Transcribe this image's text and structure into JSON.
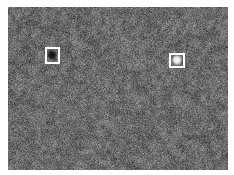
{
  "figure": {
    "type": "annotated-grayscale-micrograph",
    "canvas_width": 234,
    "canvas_height": 175,
    "background_color": "#ffffff"
  },
  "image_panel": {
    "name": "grayscale-texture-image",
    "left": 8,
    "top": 7,
    "width": 220,
    "height": 163,
    "base_gray": "#6b6b6b",
    "mean_level": 107,
    "noise_amplitude": 34,
    "description": "Uniform granular mid-gray noise texture, speckled, no visible gradient"
  },
  "annotations": [
    {
      "name": "annotation-box-dark-feature",
      "label": "",
      "left": 45,
      "top": 47,
      "width": 15,
      "height": 17,
      "border_color": "#ffffff",
      "border_width": 2,
      "feature": {
        "name": "dark-blob",
        "kind": "dark",
        "center_x": 52,
        "center_y": 55,
        "radius": 4,
        "color": "#1c1c1c",
        "description": "Small dark circular blob / pit"
      }
    },
    {
      "name": "annotation-box-bright-feature",
      "label": "",
      "left": 169,
      "top": 53,
      "width": 16,
      "height": 15,
      "border_color": "#ffffff",
      "border_width": 2,
      "feature": {
        "name": "bright-blob",
        "kind": "bright",
        "center_x": 177,
        "center_y": 60,
        "radius": 4,
        "color": "#f2f2f2",
        "description": "Small bright circular blob / particle"
      }
    }
  ]
}
